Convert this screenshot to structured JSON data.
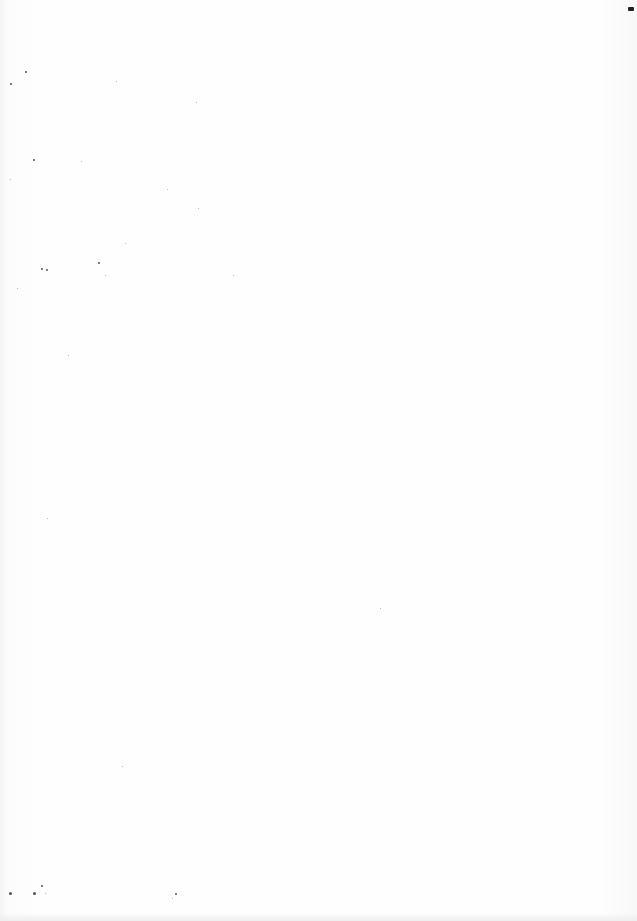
{
  "page": {
    "background": "#fdfdfd",
    "content": "",
    "specks": [
      {
        "x": 25,
        "y": 71,
        "s": 2
      },
      {
        "x": 10,
        "y": 83,
        "s": 2
      },
      {
        "x": 116,
        "y": 81,
        "s": 1
      },
      {
        "x": 196,
        "y": 102,
        "s": 1
      },
      {
        "x": 33,
        "y": 159,
        "s": 2
      },
      {
        "x": 81,
        "y": 161,
        "s": 1
      },
      {
        "x": 10,
        "y": 179,
        "s": 1
      },
      {
        "x": 167,
        "y": 189,
        "s": 1
      },
      {
        "x": 198,
        "y": 208,
        "s": 1
      },
      {
        "x": 125,
        "y": 243,
        "s": 1
      },
      {
        "x": 41,
        "y": 268,
        "s": 2
      },
      {
        "x": 46,
        "y": 269,
        "s": 2
      },
      {
        "x": 98,
        "y": 262,
        "s": 2
      },
      {
        "x": 233,
        "y": 275,
        "s": 1
      },
      {
        "x": 105,
        "y": 275,
        "s": 1
      },
      {
        "x": 17,
        "y": 288,
        "s": 1
      },
      {
        "x": 68,
        "y": 355,
        "s": 1
      },
      {
        "x": 47,
        "y": 518,
        "s": 1
      },
      {
        "x": 380,
        "y": 608,
        "s": 1
      },
      {
        "x": 122,
        "y": 766,
        "s": 1
      },
      {
        "x": 9,
        "y": 892,
        "s": 3
      },
      {
        "x": 33,
        "y": 892,
        "s": 3
      },
      {
        "x": 41,
        "y": 885,
        "s": 2
      },
      {
        "x": 45,
        "y": 893,
        "s": 1
      },
      {
        "x": 175,
        "y": 893,
        "s": 2
      },
      {
        "x": 172,
        "y": 898,
        "s": 1
      }
    ],
    "corner_mark": {
      "x": 628,
      "y": 7
    }
  }
}
